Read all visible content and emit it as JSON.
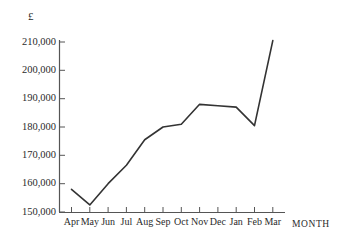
{
  "chart_data": {
    "type": "line",
    "title": "",
    "subtitle": "",
    "xlabel": "MONTH",
    "ylabel": "£",
    "categories": [
      "Apr",
      "May",
      "Jun",
      "Jul",
      "Aug",
      "Sep",
      "Oct",
      "Nov",
      "Dec",
      "Jan",
      "Feb",
      "Mar"
    ],
    "values": [
      158000,
      152500,
      160000,
      166500,
      175500,
      180000,
      181000,
      188000,
      187500,
      187000,
      180500,
      210500
    ],
    "series": [
      {
        "name": "",
        "values": [
          158000,
          152500,
          160000,
          166500,
          175500,
          180000,
          181000,
          188000,
          187500,
          187000,
          180500,
          210500
        ]
      }
    ],
    "ylim": [
      150000,
      210000
    ],
    "ytick_values": [
      150000,
      160000,
      170000,
      180000,
      190000,
      200000,
      210000
    ],
    "ytick_labels": [
      "150,000",
      "160,000",
      "170,000",
      "180,000",
      "190,000",
      "200,000",
      "210,000"
    ],
    "grid": false,
    "legend": null,
    "line_color": "#333333"
  },
  "axes": {
    "y_axis_title": "£",
    "x_axis_title": "MONTH"
  },
  "colors": {
    "line": "#333333",
    "axis": "#555555",
    "text": "#2b2b2b",
    "background": "#ffffff"
  }
}
